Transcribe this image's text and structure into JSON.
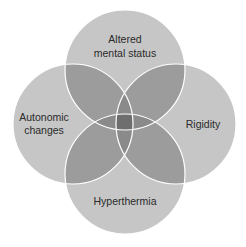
{
  "diagram": {
    "type": "venn",
    "sets": [
      {
        "id": "top",
        "label_lines": [
          "Altered",
          "mental status"
        ],
        "cx": 125,
        "cy": 70,
        "r": 60
      },
      {
        "id": "left",
        "label_lines": [
          "Autonomic",
          "changes"
        ],
        "cx": 73,
        "cy": 124,
        "r": 60
      },
      {
        "id": "right",
        "label_lines": [
          "Rigidity"
        ],
        "cx": 176,
        "cy": 124,
        "r": 60
      },
      {
        "id": "bottom",
        "label_lines": [
          "Hyperthermia"
        ],
        "cx": 125,
        "cy": 174,
        "r": 60
      }
    ],
    "colors": {
      "single": "#c6c6c6",
      "double": "#9c9c9c",
      "quad": "#707070",
      "stroke": "#ffffff"
    }
  },
  "labels": {
    "top_line1": "Altered",
    "top_line2": "mental status",
    "left_line1": "Autonomic",
    "left_line2": "changes",
    "right": "Rigidity",
    "bottom": "Hyperthermia"
  }
}
